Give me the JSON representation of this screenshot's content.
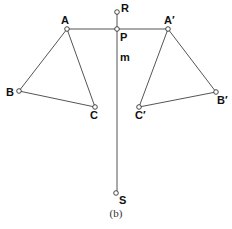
{
  "diagram": {
    "caption": "(b)",
    "line_label": "m",
    "points": {
      "R": {
        "label": "R",
        "x": 117,
        "y": 12
      },
      "P": {
        "label": "P",
        "x": 117,
        "y": 29
      },
      "A": {
        "label": "A",
        "x": 67,
        "y": 29
      },
      "B": {
        "label": "B",
        "x": 19,
        "y": 91
      },
      "C": {
        "label": "C",
        "x": 95,
        "y": 107
      },
      "A_prime": {
        "label": "A′",
        "x": 168,
        "y": 29
      },
      "B_prime": {
        "label": "B′",
        "x": 216,
        "y": 92
      },
      "C_prime": {
        "label": "C′",
        "x": 139,
        "y": 107
      },
      "S": {
        "label": "S",
        "x": 117,
        "y": 193
      }
    },
    "segments": [
      [
        "R",
        "S"
      ],
      [
        "A",
        "A_prime"
      ],
      [
        "A",
        "B"
      ],
      [
        "B",
        "C"
      ],
      [
        "C",
        "A"
      ],
      [
        "A_prime",
        "B_prime"
      ],
      [
        "B_prime",
        "C_prime"
      ],
      [
        "C_prime",
        "A_prime"
      ]
    ]
  }
}
